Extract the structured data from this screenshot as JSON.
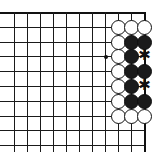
{
  "figure": {
    "kind": "go-board-diagram",
    "title": "",
    "board": {
      "origin_x": 14,
      "origin_y": 12,
      "col_spacing": 13,
      "row_spacing": 14.8,
      "columns": 11,
      "rows": 10,
      "line_color": "#1a1a1a",
      "edge_color": "#111111",
      "background": "#ffffff",
      "bottom_overhang": 7
    },
    "star_points": [
      {
        "col": 7,
        "row": 3,
        "label": "hoshi"
      }
    ],
    "stones": [
      {
        "col": 8,
        "row": 1,
        "color": "white"
      },
      {
        "col": 9,
        "row": 1,
        "color": "white"
      },
      {
        "col": 10,
        "row": 1,
        "color": "white"
      },
      {
        "col": 8,
        "row": 2,
        "color": "white"
      },
      {
        "col": 9,
        "row": 2,
        "color": "black"
      },
      {
        "col": 10,
        "row": 2,
        "color": "black"
      },
      {
        "col": 8,
        "row": 3,
        "color": "white"
      },
      {
        "col": 9,
        "row": 3,
        "color": "black"
      },
      {
        "col": 8,
        "row": 4,
        "color": "white"
      },
      {
        "col": 9,
        "row": 4,
        "color": "black"
      },
      {
        "col": 10,
        "row": 4,
        "color": "black"
      },
      {
        "col": 8,
        "row": 5,
        "color": "white"
      },
      {
        "col": 9,
        "row": 5,
        "color": "black"
      },
      {
        "col": 8,
        "row": 6,
        "color": "white"
      },
      {
        "col": 9,
        "row": 6,
        "color": "black"
      },
      {
        "col": 10,
        "row": 6,
        "color": "black"
      },
      {
        "col": 8,
        "row": 7,
        "color": "white"
      },
      {
        "col": 9,
        "row": 7,
        "color": "white"
      },
      {
        "col": 10,
        "row": 7,
        "color": "white"
      }
    ],
    "marks": [
      {
        "col": 10,
        "row": 3,
        "glyph": "✱",
        "type": "asterisk"
      },
      {
        "col": 10,
        "row": 5,
        "glyph": "✱",
        "type": "asterisk"
      }
    ],
    "colors": {
      "white_stone_fill": "#ffffff",
      "white_stone_border": "#111111",
      "black_stone_fill": "#1b1b1b",
      "mark_color": "#111111"
    }
  }
}
